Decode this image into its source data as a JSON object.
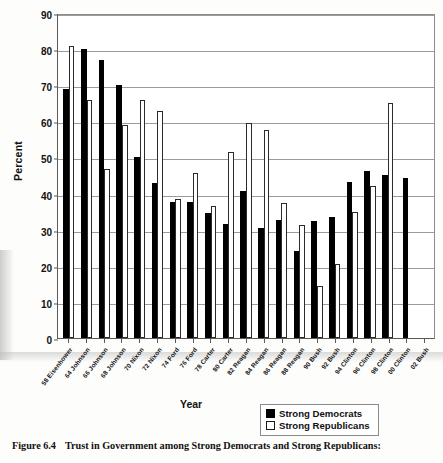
{
  "figure": {
    "caption_number": "Figure 6.4",
    "caption_text": "Trust in Government among Strong Democrats and Strong Republicans:"
  },
  "legend": {
    "items": [
      {
        "label": "Strong Democrats",
        "swatch": "filled-black-square"
      },
      {
        "label": "Strong Republicans",
        "swatch": "open-white-square"
      }
    ]
  },
  "chart_data": {
    "type": "bar",
    "title": "",
    "xlabel": "Year",
    "ylabel": "Percent",
    "ylim": [
      0,
      90
    ],
    "yticks": [
      0,
      10,
      20,
      30,
      40,
      50,
      60,
      70,
      80,
      90
    ],
    "grid": true,
    "legend_position": "bottom-right",
    "categories": [
      "58 Eisenhower",
      "64 Johnson",
      "66 Johnson",
      "68 Johnson",
      "70 Nixon",
      "72 Nixon",
      "74 Ford",
      "76 Ford",
      "78 Carter",
      "80 Carter",
      "82 Reagan",
      "84 Reagan",
      "86 Reagan",
      "88 Reagan",
      "90 Bush",
      "92 Bush",
      "94 Clinton",
      "96 Clinton",
      "98 Clinton",
      "00 Clinton",
      "02 Bush"
    ],
    "series": [
      {
        "name": "Strong Democrats",
        "color": "#000000",
        "values": [
          69,
          80,
          77,
          70,
          50,
          43,
          37.8,
          37.7,
          34.6,
          31.7,
          40.6,
          30.6,
          32.6,
          24,
          32.4,
          33.4,
          43.2,
          46.2,
          45.2,
          44.2,
          0
        ]
      },
      {
        "name": "Strong Republicans",
        "color": "#ffffff",
        "values": [
          81,
          66,
          46.8,
          59,
          66,
          62.8,
          38.6,
          45.6,
          36.5,
          51.5,
          59.6,
          57.5,
          37.3,
          31.3,
          14.5,
          20.5,
          35,
          42.1,
          65,
          0,
          0
        ]
      }
    ]
  },
  "axis": {
    "y_ticks": [
      "90",
      "80",
      "70",
      "60",
      "50",
      "40",
      "30",
      "20",
      "10",
      "0"
    ]
  }
}
